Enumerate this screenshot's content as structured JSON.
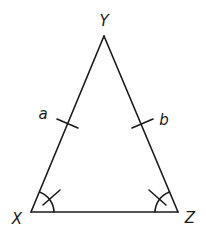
{
  "diagram": {
    "type": "isosceles-triangle",
    "stroke_color": "#1a1a1a",
    "vertices": [
      {
        "name": "Y",
        "label": "Y",
        "x": 104,
        "y": 36,
        "label_x": 104,
        "label_y": 21
      },
      {
        "name": "X",
        "label": "X",
        "x": 31,
        "y": 212,
        "label_x": 17,
        "label_y": 219
      },
      {
        "name": "Z",
        "label": "Z",
        "x": 178,
        "y": 212,
        "label_x": 190,
        "label_y": 218
      }
    ],
    "sides": [
      {
        "name": "XY",
        "label": "a",
        "tick_marks": 1,
        "label_x": 43,
        "label_y": 114
      },
      {
        "name": "YZ",
        "label": "b",
        "tick_marks": 1,
        "label_x": 164,
        "label_y": 120
      },
      {
        "name": "XZ",
        "label": "",
        "tick_marks": 0
      }
    ],
    "angle_marks": [
      {
        "vertex": "X",
        "arcs": 1,
        "ticks": 1
      },
      {
        "vertex": "Z",
        "arcs": 1,
        "ticks": 1
      }
    ]
  }
}
